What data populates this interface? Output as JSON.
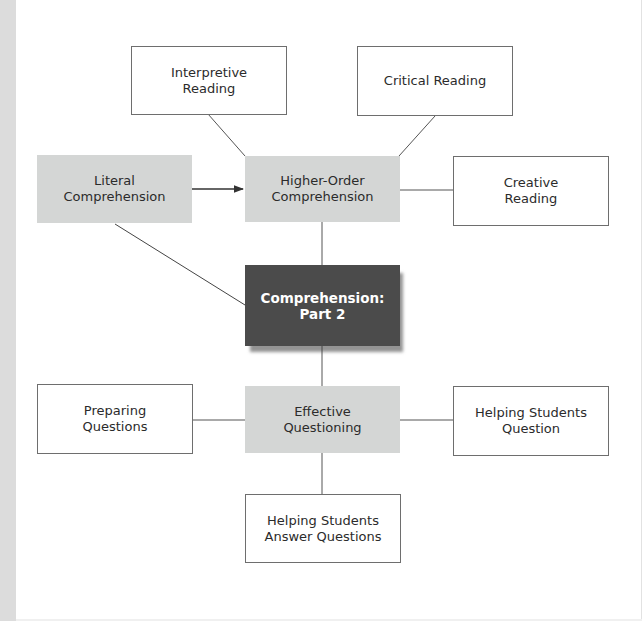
{
  "diagram": {
    "type": "concept-map",
    "colors": {
      "outline_border": "#6e6e6e",
      "shaded_fill": "#d4d6d5",
      "center_fill": "#4b4b4b",
      "center_text": "#ffffff",
      "connector": "#555555",
      "left_strip": "#dcdcdc"
    },
    "nodes": {
      "interpretive_reading": {
        "label": "Interpretive\nReading",
        "style": "outline"
      },
      "critical_reading": {
        "label": "Critical Reading",
        "style": "outline"
      },
      "literal_comprehension": {
        "label": "Literal\nComprehension",
        "style": "shaded"
      },
      "higher_order_comprehension": {
        "label": "Higher-Order\nComprehension",
        "style": "shaded"
      },
      "creative_reading": {
        "label": "Creative\nReading",
        "style": "outline"
      },
      "comprehension_part2": {
        "label": "Comprehension:\nPart 2",
        "style": "dark"
      },
      "preparing_questions": {
        "label": "Preparing\nQuestions",
        "style": "outline"
      },
      "effective_questioning": {
        "label": "Effective\nQuestioning",
        "style": "shaded"
      },
      "helping_students_question": {
        "label": "Helping Students\nQuestion",
        "style": "outline"
      },
      "helping_students_answer": {
        "label": "Helping Students\nAnswer Questions",
        "style": "outline"
      }
    },
    "edges": [
      {
        "from": "literal_comprehension",
        "to": "higher_order_comprehension",
        "arrow": true
      },
      {
        "from": "interpretive_reading",
        "to": "higher_order_comprehension",
        "arrow": false
      },
      {
        "from": "critical_reading",
        "to": "higher_order_comprehension",
        "arrow": false
      },
      {
        "from": "higher_order_comprehension",
        "to": "creative_reading",
        "arrow": false
      },
      {
        "from": "higher_order_comprehension",
        "to": "comprehension_part2",
        "arrow": false
      },
      {
        "from": "literal_comprehension",
        "to": "comprehension_part2",
        "arrow": false
      },
      {
        "from": "comprehension_part2",
        "to": "effective_questioning",
        "arrow": false
      },
      {
        "from": "preparing_questions",
        "to": "effective_questioning",
        "arrow": false
      },
      {
        "from": "effective_questioning",
        "to": "helping_students_question",
        "arrow": false
      },
      {
        "from": "effective_questioning",
        "to": "helping_students_answer",
        "arrow": false
      }
    ]
  }
}
